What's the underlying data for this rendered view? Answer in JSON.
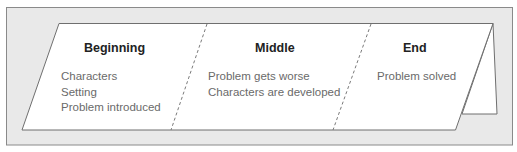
{
  "diagram": {
    "type": "folded-story-card",
    "colors": {
      "frame_bg": "#e9e9e9",
      "frame_border": "#8a8a8a",
      "card_fill": "#ffffff",
      "card_border": "#6f6f6f",
      "fold_line": "#7a7a7a",
      "heading_text": "#222222",
      "body_text": "#6a6a6a"
    },
    "sections": [
      {
        "heading": "Beginning",
        "lines": [
          "Characters",
          "Setting",
          "Problem introduced"
        ]
      },
      {
        "heading": "Middle",
        "lines": [
          "Problem gets worse",
          "Characters are developed"
        ]
      },
      {
        "heading": "End",
        "lines": [
          "Problem solved"
        ]
      }
    ]
  }
}
